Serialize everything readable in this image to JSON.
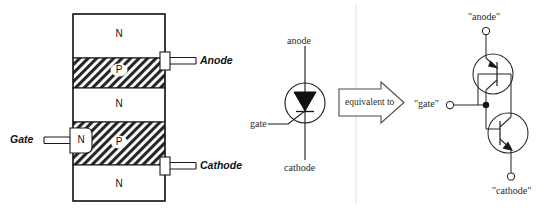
{
  "figure": {
    "divider_color": "#e2e2e2",
    "ink_color": "#1a1a1a",
    "hatch_color": "#222222"
  },
  "block_diagram": {
    "name": "scr-four-layer-structure",
    "layers": [
      {
        "id": "layer-n-top",
        "dope": "N",
        "type": "n",
        "fill": "plain"
      },
      {
        "id": "layer-p-upper",
        "dope": "P",
        "type": "p",
        "fill": "hatched"
      },
      {
        "id": "layer-n-middle",
        "dope": "N",
        "type": "n",
        "fill": "plain"
      },
      {
        "id": "layer-p-lower",
        "dope": "P",
        "type": "p",
        "fill": "hatched"
      },
      {
        "id": "layer-n-bottom",
        "dope": "N",
        "type": "n",
        "fill": "plain"
      }
    ],
    "gate_pocket_dope": "N",
    "terminals": [
      {
        "id": "terminal-anode",
        "label": "Anode",
        "side": "right",
        "attaches_to": "layer-p-upper"
      },
      {
        "id": "terminal-gate",
        "label": "Gate",
        "side": "left",
        "attaches_to": "layer-p-lower"
      },
      {
        "id": "terminal-cathode",
        "label": "Cathode",
        "side": "right",
        "attaches_to": "layer-p-lower"
      }
    ]
  },
  "scr_symbol": {
    "name": "scr-schematic-symbol",
    "anode_label": "anode",
    "gate_label": "gate",
    "cathode_label": "cathode"
  },
  "equivalence_arrow": {
    "label": "equivalent to"
  },
  "equivalent_circuit": {
    "name": "two-transistor-equivalent-circuit",
    "anode_label": "\"anode\"",
    "gate_label": "\"gate\"",
    "cathode_label": "\"cathode\"",
    "transistors": [
      {
        "id": "transistor-pnp-upper",
        "type": "PNP"
      },
      {
        "id": "transistor-npn-lower",
        "type": "NPN"
      }
    ]
  }
}
